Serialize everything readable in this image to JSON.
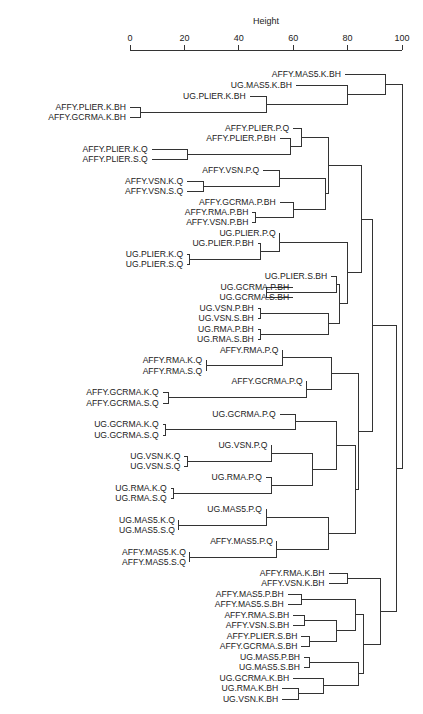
{
  "chart_data": {
    "type": "dendrogram",
    "title": "",
    "xlabel": "Height",
    "ylabel": "",
    "xlim": [
      0,
      100
    ],
    "ticks": [
      0,
      20,
      40,
      60,
      80,
      100
    ],
    "axis_position": "top",
    "grid": false,
    "leaves": [
      {
        "id": "L1",
        "label": "AFFY.MAS5.K.BH",
        "y": 74
      },
      {
        "id": "L2",
        "label": "UG.MAS5.K.BH",
        "y": 85
      },
      {
        "id": "L3",
        "label": "UG.PLIER.K.BH",
        "y": 96
      },
      {
        "id": "L4",
        "label": "AFFY.PLIER.K.BH",
        "y": 107
      },
      {
        "id": "L5",
        "label": "AFFY.GCRMA.K.BH",
        "y": 117
      },
      {
        "id": "L6",
        "label": "AFFY.PLIER.P.Q",
        "y": 128
      },
      {
        "id": "L7",
        "label": "AFFY.PLIER.P.BH",
        "y": 138
      },
      {
        "id": "L8",
        "label": "AFFY.PLIER.K.Q",
        "y": 149
      },
      {
        "id": "L9",
        "label": "AFFY.PLIER.S.Q",
        "y": 159
      },
      {
        "id": "L10",
        "label": "AFFY.VSN.P.Q",
        "y": 170
      },
      {
        "id": "L11",
        "label": "AFFY.VSN.K.Q",
        "y": 181
      },
      {
        "id": "L12",
        "label": "AFFY.VSN.S.Q",
        "y": 191
      },
      {
        "id": "L13",
        "label": "AFFY.GCRMA.P.BH",
        "y": 202
      },
      {
        "id": "L14",
        "label": "AFFY.RMA.P.BH",
        "y": 212
      },
      {
        "id": "L15",
        "label": "AFFY.VSN.P.BH",
        "y": 222
      },
      {
        "id": "L16",
        "label": "UG.PLIER.P.Q",
        "y": 233
      },
      {
        "id": "L17",
        "label": "UG.PLIER.P.BH",
        "y": 243
      },
      {
        "id": "L18",
        "label": "UG.PLIER.K.Q",
        "y": 254
      },
      {
        "id": "L19",
        "label": "UG.PLIER.S.Q",
        "y": 264
      },
      {
        "id": "L20",
        "label": "UG.PLIER.S.BH",
        "y": 276
      },
      {
        "id": "L21",
        "label": "UG.GCRMA.P.BH",
        "y": 287
      },
      {
        "id": "L22",
        "label": "UG.GCRMA.S.BH",
        "y": 297
      },
      {
        "id": "L23",
        "label": "UG.VSN.P.BH",
        "y": 308
      },
      {
        "id": "L24",
        "label": "UG.VSN.S.BH",
        "y": 318
      },
      {
        "id": "L25",
        "label": "UG.RMA.P.BH",
        "y": 329
      },
      {
        "id": "L26",
        "label": "UG.RMA.S.BH",
        "y": 339
      },
      {
        "id": "L27",
        "label": "AFFY.RMA.P.Q",
        "y": 350
      },
      {
        "id": "L28",
        "label": "AFFY.RMA.K.Q",
        "y": 360
      },
      {
        "id": "L29",
        "label": "AFFY.RMA.S.Q",
        "y": 371
      },
      {
        "id": "L30",
        "label": "AFFY.GCRMA.P.Q",
        "y": 381
      },
      {
        "id": "L31",
        "label": "AFFY.GCRMA.K.Q",
        "y": 392
      },
      {
        "id": "L32",
        "label": "AFFY.GCRMA.S.Q",
        "y": 403
      },
      {
        "id": "L33",
        "label": "UG.GCRMA.P.Q",
        "y": 414
      },
      {
        "id": "L34",
        "label": "UG.GCRMA.K.Q",
        "y": 424
      },
      {
        "id": "L35",
        "label": "UG.GCRMA.S.Q",
        "y": 435
      },
      {
        "id": "L36",
        "label": "UG.VSN.P.Q",
        "y": 445
      },
      {
        "id": "L37",
        "label": "UG.VSN.K.Q",
        "y": 456
      },
      {
        "id": "L38",
        "label": "UG.VSN.S.Q",
        "y": 466
      },
      {
        "id": "L39",
        "label": "UG.RMA.P.Q",
        "y": 477
      },
      {
        "id": "L40",
        "label": "UG.RMA.K.Q",
        "y": 488
      },
      {
        "id": "L41",
        "label": "UG.RMA.S.Q",
        "y": 498
      },
      {
        "id": "L42",
        "label": "UG.MAS5.P.Q",
        "y": 509
      },
      {
        "id": "L43",
        "label": "UG.MAS5.K.Q",
        "y": 520
      },
      {
        "id": "L44",
        "label": "UG.MAS5.S.Q",
        "y": 530
      },
      {
        "id": "L45",
        "label": "AFFY.MAS5.P.Q",
        "y": 541
      },
      {
        "id": "L46",
        "label": "AFFY.MAS5.K.Q",
        "y": 552
      },
      {
        "id": "L47",
        "label": "AFFY.MAS5.S.Q",
        "y": 562
      },
      {
        "id": "L48",
        "label": "AFFY.RMA.K.BH",
        "y": 573
      },
      {
        "id": "L49",
        "label": "AFFY.VSN.K.BH",
        "y": 583
      },
      {
        "id": "L50",
        "label": "AFFY.MAS5.P.BH",
        "y": 594
      },
      {
        "id": "L51",
        "label": "AFFY.MAS5.S.BH",
        "y": 604
      },
      {
        "id": "L52",
        "label": "AFFY.RMA.S.BH",
        "y": 615
      },
      {
        "id": "L53",
        "label": "AFFY.VSN.S.BH",
        "y": 625
      },
      {
        "id": "L54",
        "label": "AFFY.PLIER.S.BH",
        "y": 636
      },
      {
        "id": "L55",
        "label": "AFFY.GCRMA.S.BH",
        "y": 646
      },
      {
        "id": "L56",
        "label": "UG.MAS5.P.BH",
        "y": 657
      },
      {
        "id": "L57",
        "label": "UG.MAS5.S.BH",
        "y": 667
      },
      {
        "id": "L58",
        "label": "UG.GCRMA.K.BH",
        "y": 678
      },
      {
        "id": "L59",
        "label": "UG.RMA.K.BH",
        "y": 688
      },
      {
        "id": "L60",
        "label": "UG.VSN.K.BH",
        "y": 699
      }
    ],
    "leaf_heights": {
      "L1": 79,
      "L2": 61,
      "L3": 44,
      "L4": 0,
      "L5": 0,
      "L6": 60,
      "L7": 55,
      "L8": 8,
      "L9": 8,
      "L10": 49,
      "L11": 21,
      "L12": 21,
      "L13": 55,
      "L14": 45,
      "L15": 45,
      "L16": 55,
      "L17": 47,
      "L18": 21,
      "L19": 21,
      "L20": 74,
      "L21": 60,
      "L22": 60,
      "L23": 47,
      "L24": 47,
      "L25": 47,
      "L26": 47,
      "L27": 56,
      "L28": 28,
      "L29": 28,
      "L30": 65,
      "L31": 12,
      "L32": 12,
      "L33": 55,
      "L34": 12,
      "L35": 12,
      "L36": 52,
      "L37": 20,
      "L38": 20,
      "L39": 50,
      "L40": 15,
      "L41": 15,
      "L42": 50,
      "L43": 18,
      "L44": 18,
      "L45": 54,
      "L46": 22,
      "L47": 22,
      "L48": 73,
      "L49": 73,
      "L50": 58,
      "L51": 58,
      "L52": 60,
      "L53": 60,
      "L54": 63,
      "L55": 63,
      "L56": 64,
      "L57": 64,
      "L58": 60,
      "L59": 56,
      "L60": 56
    },
    "merges": [
      {
        "id": "N1",
        "children": [
          "L4",
          "L5"
        ],
        "height": 4
      },
      {
        "id": "N2",
        "children": [
          "L3",
          "N1"
        ],
        "height": 50
      },
      {
        "id": "N3",
        "children": [
          "L2",
          "N2"
        ],
        "height": 80
      },
      {
        "id": "N4",
        "children": [
          "L1",
          "N3"
        ],
        "height": 94
      },
      {
        "id": "N5",
        "children": [
          "L8",
          "L9"
        ],
        "height": 21
      },
      {
        "id": "N6",
        "children": [
          "L7",
          "N5"
        ],
        "height": 59
      },
      {
        "id": "N7",
        "children": [
          "L6",
          "N6"
        ],
        "height": 63
      },
      {
        "id": "N8",
        "children": [
          "L11",
          "L12"
        ],
        "height": 27
      },
      {
        "id": "N9",
        "children": [
          "L10",
          "N8"
        ],
        "height": 55
      },
      {
        "id": "N10",
        "children": [
          "L14",
          "L15"
        ],
        "height": 46
      },
      {
        "id": "N11",
        "children": [
          "L13",
          "N10"
        ],
        "height": 60
      },
      {
        "id": "N12",
        "children": [
          "N9",
          "N11"
        ],
        "height": 72
      },
      {
        "id": "N13",
        "children": [
          "N7",
          "N12"
        ],
        "height": 73
      },
      {
        "id": "N14",
        "children": [
          "L18",
          "L19"
        ],
        "height": 22
      },
      {
        "id": "N15",
        "children": [
          "L17",
          "N14"
        ],
        "height": 48
      },
      {
        "id": "N16",
        "children": [
          "L16",
          "N15"
        ],
        "height": 55
      },
      {
        "id": "N17",
        "children": [
          "L21",
          "L22"
        ],
        "height": 50
      },
      {
        "id": "N18",
        "children": [
          "L20",
          "N17"
        ],
        "height": 76
      },
      {
        "id": "N19",
        "children": [
          "L23",
          "L24"
        ],
        "height": 48
      },
      {
        "id": "N20",
        "children": [
          "L25",
          "L26"
        ],
        "height": 48
      },
      {
        "id": "N21",
        "children": [
          "N19",
          "N20"
        ],
        "height": 73
      },
      {
        "id": "N22",
        "children": [
          "N18",
          "N21"
        ],
        "height": 77
      },
      {
        "id": "N23",
        "children": [
          "N16",
          "N22"
        ],
        "height": 80
      },
      {
        "id": "N24",
        "children": [
          "N13",
          "N23"
        ],
        "height": 85
      },
      {
        "id": "N25",
        "children": [
          "L28",
          "L29"
        ],
        "height": 28
      },
      {
        "id": "N26",
        "children": [
          "L27",
          "N25"
        ],
        "height": 56
      },
      {
        "id": "N27",
        "children": [
          "L31",
          "L32"
        ],
        "height": 14
      },
      {
        "id": "N28",
        "children": [
          "L30",
          "N27"
        ],
        "height": 65
      },
      {
        "id": "N29",
        "children": [
          "N26",
          "N28"
        ],
        "height": 74
      },
      {
        "id": "N30",
        "children": [
          "L34",
          "L35"
        ],
        "height": 13
      },
      {
        "id": "N31",
        "children": [
          "L33",
          "N30"
        ],
        "height": 61
      },
      {
        "id": "N32",
        "children": [
          "L37",
          "L38"
        ],
        "height": 21
      },
      {
        "id": "N33",
        "children": [
          "L36",
          "N32"
        ],
        "height": 52
      },
      {
        "id": "N34",
        "children": [
          "L40",
          "L41"
        ],
        "height": 16
      },
      {
        "id": "N35",
        "children": [
          "L39",
          "N34"
        ],
        "height": 52
      },
      {
        "id": "N36",
        "children": [
          "N33",
          "N35"
        ],
        "height": 67
      },
      {
        "id": "N37",
        "children": [
          "N31",
          "N36"
        ],
        "height": 76
      },
      {
        "id": "N38",
        "children": [
          "L43",
          "L44"
        ],
        "height": 18
      },
      {
        "id": "N39",
        "children": [
          "L42",
          "N38"
        ],
        "height": 50
      },
      {
        "id": "N40",
        "children": [
          "L46",
          "L47"
        ],
        "height": 22
      },
      {
        "id": "N41",
        "children": [
          "L45",
          "N40"
        ],
        "height": 54
      },
      {
        "id": "N42",
        "children": [
          "N39",
          "N41"
        ],
        "height": 73
      },
      {
        "id": "N43",
        "children": [
          "N37",
          "N42"
        ],
        "height": 83
      },
      {
        "id": "N44",
        "children": [
          "N29",
          "N43"
        ],
        "height": 84
      },
      {
        "id": "N45",
        "children": [
          "N24",
          "N44"
        ],
        "height": 89
      },
      {
        "id": "N46",
        "children": [
          "L48",
          "L49"
        ],
        "height": 80
      },
      {
        "id": "N47",
        "children": [
          "L50",
          "L51"
        ],
        "height": 63
      },
      {
        "id": "N48",
        "children": [
          "L52",
          "L53"
        ],
        "height": 64
      },
      {
        "id": "N49",
        "children": [
          "L54",
          "L55"
        ],
        "height": 66
      },
      {
        "id": "N50",
        "children": [
          "N48",
          "N49"
        ],
        "height": 76
      },
      {
        "id": "N51",
        "children": [
          "N47",
          "N50"
        ],
        "height": 83
      },
      {
        "id": "N52",
        "children": [
          "L56",
          "L57"
        ],
        "height": 66
      },
      {
        "id": "N53",
        "children": [
          "L59",
          "L60"
        ],
        "height": 62
      },
      {
        "id": "N54",
        "children": [
          "L58",
          "N53"
        ],
        "height": 71
      },
      {
        "id": "N55",
        "children": [
          "N52",
          "N54"
        ],
        "height": 84
      },
      {
        "id": "N56",
        "children": [
          "N51",
          "N55"
        ],
        "height": 86
      },
      {
        "id": "N57",
        "children": [
          "N46",
          "N56"
        ],
        "height": 92
      },
      {
        "id": "N58",
        "children": [
          "N45",
          "N57"
        ],
        "height": 98
      },
      {
        "id": "N59",
        "children": [
          "N4",
          "N58"
        ],
        "height": 100
      }
    ]
  },
  "layout": {
    "x0_px": 130,
    "x100_px": 402,
    "axis_y": 50,
    "axis_title_y": 24,
    "tick_label_y": 41
  }
}
